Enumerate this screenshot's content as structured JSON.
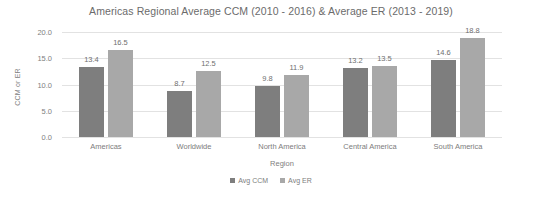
{
  "chart_data": {
    "type": "bar",
    "title": "Americas Regional Average CCM (2010 - 2016) & Average ER (2013 - 2019)",
    "xlabel": "Region",
    "ylabel": "CCM or ER",
    "ylim": [
      0,
      20
    ],
    "yticks": [
      "0.0",
      "5.0",
      "10.0",
      "15.0",
      "20.0"
    ],
    "ytick_values": [
      0,
      5,
      10,
      15,
      20
    ],
    "grid": true,
    "legend_position": "bottom",
    "categories": [
      "Americas",
      "Worldwide",
      "North America",
      "Central America",
      "South America"
    ],
    "series": [
      {
        "name": "Avg CCM",
        "color": "#7e7e7e",
        "values": [
          13.4,
          8.7,
          9.8,
          13.2,
          14.6
        ],
        "labels": [
          "13.4",
          "8.7",
          "9.8",
          "13.2",
          "14.6"
        ]
      },
      {
        "name": "Avg ER",
        "color": "#a8a8a8",
        "values": [
          16.5,
          12.5,
          11.9,
          13.5,
          18.8
        ],
        "labels": [
          "16.5",
          "12.5",
          "11.9",
          "13.5",
          "18.8"
        ]
      }
    ]
  }
}
